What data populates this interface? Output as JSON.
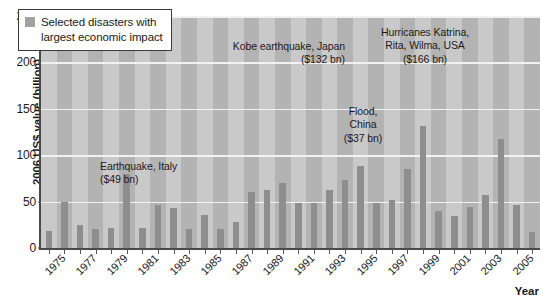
{
  "chart_data": {
    "type": "bar",
    "title": "",
    "xlabel": "Year",
    "ylabel": "2006 US$ value (billion)",
    "ylim": [
      0,
      250
    ],
    "yticks": [
      0,
      50,
      100,
      150,
      200,
      250
    ],
    "grid": "horizontal",
    "legend_position": "top-left",
    "legend": [
      {
        "label": "Selected disasters with\nlargest economic impact",
        "color": "#a2a2a2"
      }
    ],
    "series_color": "#8e8e8e",
    "plot_background": "#c9c9c9",
    "plot_stripe_color": "#b3b3b3",
    "gridline_color": "#f2f2f2",
    "categories": [
      "1975",
      "1976",
      "1977",
      "1978",
      "1979",
      "1980",
      "1981",
      "1982",
      "1983",
      "1984",
      "1985",
      "1986",
      "1987",
      "1988",
      "1989",
      "1990",
      "1991",
      "1992",
      "1993",
      "1994",
      "1995",
      "1996",
      "1997",
      "1998",
      "1999",
      "2000",
      "2001",
      "2002",
      "2003",
      "2004",
      "2005",
      "2006"
    ],
    "xtick_labels": [
      "1975",
      "1977",
      "1979",
      "1981",
      "1983",
      "1985",
      "1987",
      "1989",
      "1991",
      "1993",
      "1995",
      "1997",
      "1999",
      "2001",
      "2003",
      "2005"
    ],
    "values": [
      18,
      50,
      25,
      20,
      22,
      80,
      22,
      46,
      43,
      20,
      36,
      20,
      28,
      60,
      62,
      70,
      49,
      49,
      62,
      73,
      88,
      48,
      52,
      85,
      132,
      40,
      35,
      44,
      57,
      118,
      46,
      17
    ],
    "annotations": [
      {
        "text": "Earthquake, Italy\n($49 bn)",
        "year": "1980",
        "value": 80
      },
      {
        "text": "Kobe earthquake, Japan\n($132 bn)",
        "year": "1995",
        "value": 132
      },
      {
        "text": "Flood,\nChina\n($37 bn)",
        "year": "1998",
        "value": 37
      },
      {
        "text": "Hurricanes Katrina,\nRita, Wilma, USA\n($166 bn)",
        "year": "2005",
        "value": 166
      }
    ]
  }
}
